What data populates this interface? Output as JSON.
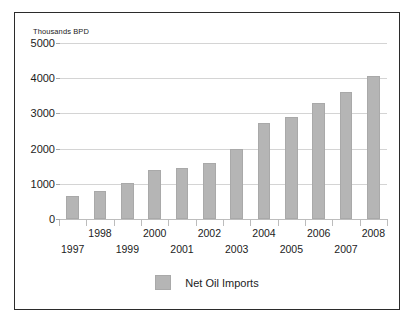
{
  "chart_data": {
    "type": "bar",
    "title": "",
    "subtitle": "",
    "xlabel": "",
    "ylabel": "Thousands BPD",
    "ylim": [
      0,
      5000
    ],
    "grid": true,
    "legend_position": "bottom-center",
    "categories": [
      "1997",
      "1998",
      "1999",
      "2000",
      "2001",
      "2002",
      "2003",
      "2004",
      "2005",
      "2006",
      "2007",
      "2008"
    ],
    "values": [
      640,
      800,
      1030,
      1400,
      1450,
      1600,
      2000,
      2740,
      2900,
      3310,
      3620,
      4050
    ],
    "series": [
      {
        "name": "Net Oil Imports",
        "color": "#b5b5b5",
        "values": [
          640,
          800,
          1030,
          1400,
          1450,
          1600,
          2000,
          2740,
          2900,
          3310,
          3620,
          4050
        ]
      }
    ],
    "y_ticks": [
      0,
      1000,
      2000,
      3000,
      4000,
      5000
    ],
    "y_tick_labels": [
      "0",
      "1000",
      "2000",
      "3000",
      "4000",
      "5000"
    ],
    "x_tick_labels_upper": [
      "1998",
      "2000",
      "2002",
      "2004",
      "2006",
      "2008"
    ],
    "x_tick_labels_lower": [
      "1997",
      "1999",
      "2001",
      "2003",
      "2005",
      "2007"
    ]
  },
  "axis": {
    "unit_caption": "Thousands BPD"
  },
  "legend": {
    "entries": [
      {
        "label": "Net Oil Imports",
        "color": "#b5b5b5"
      }
    ]
  },
  "colors": {
    "bar": "#b5b5b5",
    "bar_border": "#a9a9a9",
    "gridline": "#d4d4d4",
    "frame_border": "#2b2b2b",
    "background": "#ffffff",
    "text": "#1c1c1c"
  }
}
